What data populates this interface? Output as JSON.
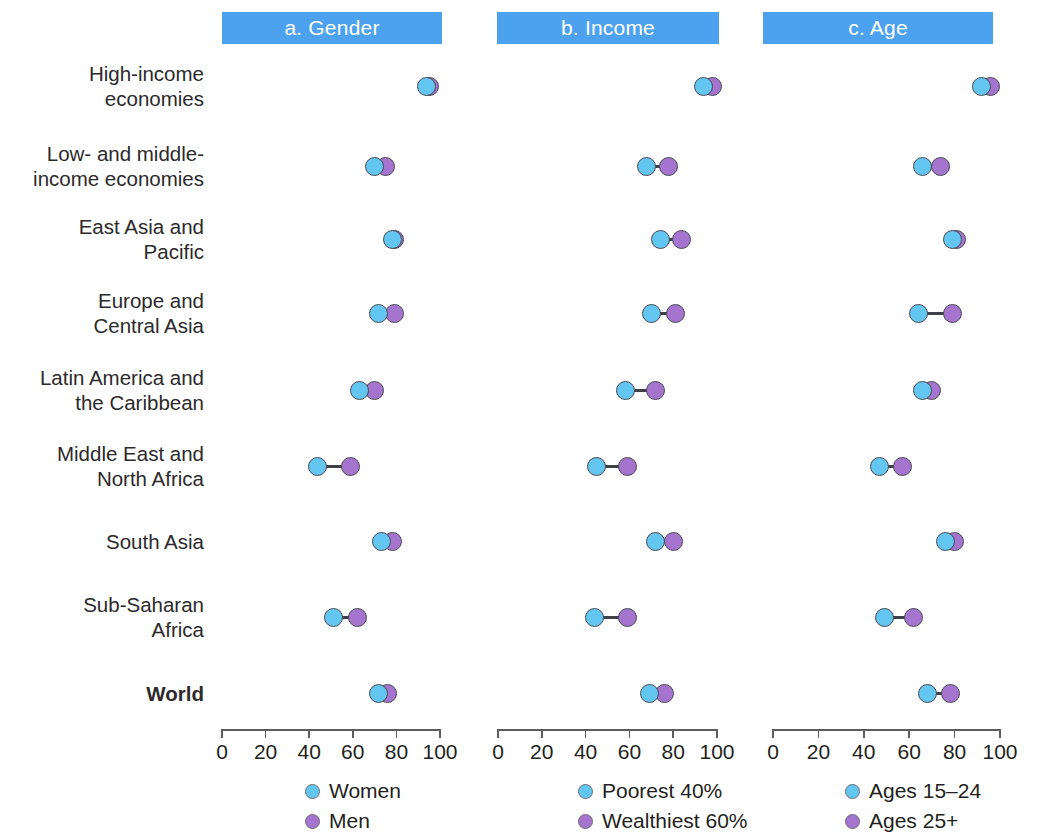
{
  "chart_data": {
    "type": "scatter",
    "subtype": "dumbbell",
    "title": "",
    "xlabel": "",
    "ylabel": "",
    "xlim": [
      0,
      100
    ],
    "xticks": [
      0,
      20,
      40,
      60,
      80,
      100
    ],
    "xtick_labels": [
      "0",
      "20",
      "40",
      "60",
      "80",
      "100"
    ],
    "grid": false,
    "categories": [
      "High-income economies",
      "Low- and middle-income economies",
      "East Asia and Pacific",
      "Europe and Central Asia",
      "Latin America and the Caribbean",
      "Middle East and North Africa",
      "South Asia",
      "Sub-Saharan Africa",
      "World"
    ],
    "panels": [
      {
        "id": "a",
        "label": "a. Gender",
        "legend": [
          "Women",
          "Men"
        ],
        "series": [
          {
            "name": "Women",
            "color": "#63c6f0",
            "values": [
              94,
              70,
              78,
              72,
              63,
              44,
              73,
              51,
              72
            ]
          },
          {
            "name": "Men",
            "color": "#a574cf",
            "values": [
              95,
              75,
              79,
              79,
              70,
              59,
              78,
              62,
              76
            ]
          }
        ]
      },
      {
        "id": "b",
        "label": "b. Income",
        "legend": [
          "Poorest 40%",
          "Wealthiest 60%"
        ],
        "series": [
          {
            "name": "Poorest 40%",
            "color": "#63c6f0",
            "values": [
              94,
              68,
              74,
              70,
              58,
              45,
              72,
              44,
              69
            ]
          },
          {
            "name": "Wealthiest 60%",
            "color": "#a574cf",
            "values": [
              98,
              78,
              84,
              81,
              72,
              59,
              80,
              59,
              76
            ]
          }
        ]
      },
      {
        "id": "c",
        "label": "c. Age",
        "legend": [
          "Ages 15–24",
          "Ages 25+"
        ],
        "series": [
          {
            "name": "Ages 15–24",
            "color": "#63c6f0",
            "values": [
              92,
              66,
              79,
              64,
              66,
              47,
              76,
              49,
              68
            ]
          },
          {
            "name": "Ages 25+",
            "color": "#a574cf",
            "values": [
              96,
              74,
              81,
              79,
              70,
              57,
              80,
              62,
              78
            ]
          }
        ]
      }
    ]
  },
  "row_labels": [
    {
      "text": "High-income\neconomies",
      "bold": false
    },
    {
      "text": "Low- and middle-\nincome economies",
      "bold": false
    },
    {
      "text": "East Asia and\nPacific",
      "bold": false
    },
    {
      "text": "Europe and\nCentral Asia",
      "bold": false
    },
    {
      "text": "Latin America and\nthe Caribbean",
      "bold": false
    },
    {
      "text": "Middle East and\nNorth Africa",
      "bold": false
    },
    {
      "text": "South Asia",
      "bold": false
    },
    {
      "text": "Sub-Saharan\nAfrica",
      "bold": false
    },
    {
      "text": "World",
      "bold": true
    }
  ],
  "colors": {
    "header_bar": "#4da2f0",
    "series_blue": "#63c6f0",
    "series_purple": "#a574cf",
    "connector": "#3f3f48",
    "axis": "#5d5d5d",
    "text": "#231f20",
    "header_text": "#ffffff"
  }
}
